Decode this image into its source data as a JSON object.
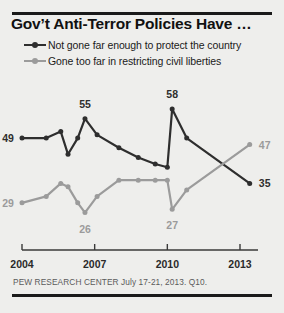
{
  "title": "Gov’t Anti-Terror Policies Have …",
  "source": "PEW RESEARCH CENTER July 17-21, 2013. Q10.",
  "colors": {
    "series_dark": "#2e2e2e",
    "series_gray": "#9b9b9b",
    "axis": "#3a3a3a",
    "background": "#eeeeec",
    "rule": "#1a1a1a",
    "title_text": "#111111",
    "source_text": "#5b5b5b"
  },
  "legend": {
    "position": "top-left",
    "items": [
      {
        "label": "Not gone far enough to protect the country",
        "color": "#2e2e2e",
        "marker": "line-dot-marker"
      },
      {
        "label": "Gone too far in restricting civil liberties",
        "color": "#9b9b9b",
        "marker": "line-dot-marker"
      }
    ]
  },
  "chart_data": {
    "type": "line",
    "title": "Gov’t Anti-Terror Policies Have …",
    "subtitle": "",
    "xlabel": "",
    "ylabel": "",
    "xlim": [
      2004,
      2013.6
    ],
    "ylim": [
      20,
      62
    ],
    "grid": false,
    "legend_position": "top-left",
    "xticks": [
      2004,
      2007,
      2010,
      2013
    ],
    "xtick_labels": [
      "2004",
      "2007",
      "2010",
      "2013"
    ],
    "series": [
      {
        "name": "Not gone far enough to protect the country",
        "color": "#2e2e2e",
        "x": [
          2004.0,
          2005.0,
          2005.6,
          2005.9,
          2006.3,
          2006.6,
          2007.1,
          2008.0,
          2008.8,
          2009.5,
          2010.0,
          2010.2,
          2010.8,
          2013.4
        ],
        "values": [
          49,
          49,
          51,
          44,
          49,
          55,
          50,
          46,
          43,
          41,
          40,
          58,
          49,
          35
        ],
        "point_labels": [
          {
            "x": 2004.0,
            "value": 49,
            "text": "49",
            "position": "left"
          },
          {
            "x": 2006.6,
            "value": 55,
            "text": "55",
            "position": "above"
          },
          {
            "x": 2010.2,
            "value": 58,
            "text": "58",
            "position": "above"
          },
          {
            "x": 2013.4,
            "value": 35,
            "text": "35",
            "position": "right"
          }
        ]
      },
      {
        "name": "Gone too far in restricting civil liberties",
        "color": "#9b9b9b",
        "x": [
          2004.0,
          2005.0,
          2005.6,
          2005.9,
          2006.3,
          2006.6,
          2007.1,
          2008.0,
          2008.8,
          2009.5,
          2010.0,
          2010.2,
          2010.8,
          2013.4
        ],
        "values": [
          29,
          31,
          35,
          34,
          29,
          26,
          31,
          36,
          36,
          36,
          36,
          27,
          33,
          47
        ],
        "point_labels": [
          {
            "x": 2004.0,
            "value": 29,
            "text": "29",
            "position": "left"
          },
          {
            "x": 2006.6,
            "value": 26,
            "text": "26",
            "position": "below"
          },
          {
            "x": 2010.2,
            "value": 27,
            "text": "27",
            "position": "below"
          },
          {
            "x": 2013.4,
            "value": 47,
            "text": "47",
            "position": "right"
          }
        ]
      }
    ]
  }
}
